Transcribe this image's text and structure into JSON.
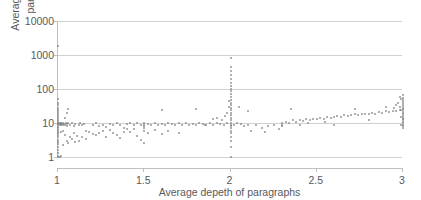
{
  "chart_data": {
    "type": "scatter",
    "title": "",
    "xlabel": "Average depeth of paragraphs",
    "ylabel_line1": "Average #triples of",
    "ylabel_line2": "paragraphs",
    "xlim": [
      1,
      3
    ],
    "ylim": [
      1,
      10000
    ],
    "yscale": "log",
    "xscale": "linear",
    "grid": true,
    "legend": false,
    "xticks": [
      "1",
      "1.5",
      "2",
      "2.5",
      "3"
    ],
    "xtick_values": [
      1,
      1.5,
      2,
      2.5,
      3
    ],
    "yticks": [
      "1",
      "10",
      "100",
      "1000",
      "10000"
    ],
    "ytick_values": [
      1,
      10,
      100,
      1000,
      10000
    ],
    "marker_color": "#808285",
    "gridline_color": "#d0d0d0",
    "axis_color": "#bfbfbf",
    "text_color": "#58595b",
    "points": [
      [
        1.0,
        1.0
      ],
      [
        1.0,
        1.1
      ],
      [
        1.0,
        1.3
      ],
      [
        1.0,
        1.6
      ],
      [
        1.0,
        2.0
      ],
      [
        1.0,
        2.4
      ],
      [
        1.0,
        2.8
      ],
      [
        1.0,
        3.2
      ],
      [
        1.0,
        3.8
      ],
      [
        1.0,
        4.4
      ],
      [
        1.0,
        5.0
      ],
      [
        1.0,
        5.6
      ],
      [
        1.0,
        6.2
      ],
      [
        1.0,
        7.0
      ],
      [
        1.0,
        7.8
      ],
      [
        1.0,
        8.6
      ],
      [
        1.0,
        9.4
      ],
      [
        1.0,
        10.0
      ],
      [
        1.0,
        11.0
      ],
      [
        1.0,
        12.5
      ],
      [
        1.0,
        14.0
      ],
      [
        1.0,
        16.0
      ],
      [
        1.0,
        18.0
      ],
      [
        1.0,
        21.0
      ],
      [
        1.0,
        24.0
      ],
      [
        1.0,
        28.0
      ],
      [
        1.0,
        33.0
      ],
      [
        1.0,
        40.0
      ],
      [
        1.0,
        50.0
      ],
      [
        1.0,
        1800.0
      ],
      [
        1.005,
        9.5
      ],
      [
        1.01,
        9.0
      ],
      [
        1.012,
        9.8
      ],
      [
        1.015,
        8.5
      ],
      [
        1.02,
        9.2
      ],
      [
        1.02,
        10.0
      ],
      [
        1.025,
        9.6
      ],
      [
        1.03,
        8.8
      ],
      [
        1.03,
        10.2
      ],
      [
        1.035,
        9.4
      ],
      [
        1.04,
        9.0
      ],
      [
        1.045,
        10.0
      ],
      [
        1.05,
        9.3
      ],
      [
        1.05,
        8.0
      ],
      [
        1.06,
        9.9
      ],
      [
        1.01,
        1.0
      ],
      [
        1.02,
        1.05
      ],
      [
        1.03,
        2.2
      ],
      [
        1.04,
        4.5
      ],
      [
        1.05,
        3.0
      ],
      [
        1.06,
        2.6
      ],
      [
        1.02,
        5.5
      ],
      [
        1.03,
        6.0
      ],
      [
        1.04,
        14.0
      ],
      [
        1.05,
        20.0
      ],
      [
        1.06,
        25.0
      ],
      [
        1.07,
        9.0
      ],
      [
        1.08,
        10.0
      ],
      [
        1.09,
        8.0
      ],
      [
        1.1,
        9.5
      ],
      [
        1.07,
        4.0
      ],
      [
        1.08,
        3.5
      ],
      [
        1.09,
        5.0
      ],
      [
        1.1,
        2.8
      ],
      [
        1.11,
        4.2
      ],
      [
        1.12,
        9.0
      ],
      [
        1.13,
        10.0
      ],
      [
        1.14,
        8.5
      ],
      [
        1.15,
        9.5
      ],
      [
        1.16,
        6.0
      ],
      [
        1.12,
        3.0
      ],
      [
        1.14,
        4.0
      ],
      [
        1.16,
        3.4
      ],
      [
        1.18,
        5.5
      ],
      [
        1.2,
        4.8
      ],
      [
        1.2,
        9.0
      ],
      [
        1.22,
        10.0
      ],
      [
        1.24,
        8.0
      ],
      [
        1.26,
        9.0
      ],
      [
        1.28,
        7.5
      ],
      [
        1.22,
        4.5
      ],
      [
        1.24,
        5.2
      ],
      [
        1.26,
        5.8
      ],
      [
        1.28,
        4.0
      ],
      [
        1.3,
        6.2
      ],
      [
        1.3,
        9.5
      ],
      [
        1.32,
        8.8
      ],
      [
        1.34,
        10.0
      ],
      [
        1.36,
        9.0
      ],
      [
        1.38,
        7.0
      ],
      [
        1.32,
        5.0
      ],
      [
        1.34,
        4.4
      ],
      [
        1.36,
        3.6
      ],
      [
        1.38,
        5.4
      ],
      [
        1.4,
        6.5
      ],
      [
        1.4,
        9.2
      ],
      [
        1.42,
        10.0
      ],
      [
        1.44,
        8.6
      ],
      [
        1.46,
        9.8
      ],
      [
        1.48,
        9.0
      ],
      [
        1.42,
        5.6
      ],
      [
        1.44,
        6.8
      ],
      [
        1.46,
        4.2
      ],
      [
        1.48,
        3.2
      ],
      [
        1.5,
        7.2
      ],
      [
        1.5,
        9.0
      ],
      [
        1.5,
        10.0
      ],
      [
        1.5,
        8.4
      ],
      [
        1.5,
        6.0
      ],
      [
        1.5,
        2.5
      ],
      [
        1.52,
        9.5
      ],
      [
        1.54,
        9.0
      ],
      [
        1.56,
        10.0
      ],
      [
        1.58,
        8.8
      ],
      [
        1.6,
        9.4
      ],
      [
        1.52,
        5.0
      ],
      [
        1.56,
        6.2
      ],
      [
        1.6,
        4.6
      ],
      [
        1.62,
        9.0
      ],
      [
        1.64,
        10.0
      ],
      [
        1.66,
        9.2
      ],
      [
        1.68,
        8.5
      ],
      [
        1.7,
        9.8
      ],
      [
        1.72,
        9.0
      ],
      [
        1.74,
        10.0
      ],
      [
        1.76,
        8.8
      ],
      [
        1.78,
        9.5
      ],
      [
        1.8,
        9.0
      ],
      [
        1.82,
        10.0
      ],
      [
        1.84,
        9.2
      ],
      [
        1.86,
        8.6
      ],
      [
        1.88,
        9.8
      ],
      [
        1.9,
        9.0
      ],
      [
        1.92,
        10.0
      ],
      [
        1.94,
        9.4
      ],
      [
        1.96,
        9.0
      ],
      [
        1.98,
        10.0
      ],
      [
        1.6,
        24.0
      ],
      [
        1.64,
        6.0
      ],
      [
        1.7,
        5.0
      ],
      [
        1.8,
        26.0
      ],
      [
        1.85,
        9.0
      ],
      [
        1.9,
        13.0
      ],
      [
        1.92,
        14.0
      ],
      [
        1.95,
        12.0
      ],
      [
        1.97,
        16.0
      ],
      [
        1.98,
        20.0
      ],
      [
        1.99,
        30.0
      ],
      [
        1.99,
        45.0
      ],
      [
        2.0,
        1.0
      ],
      [
        2.0,
        2.0
      ],
      [
        2.0,
        3.0
      ],
      [
        2.0,
        4.0
      ],
      [
        2.0,
        5.0
      ],
      [
        2.0,
        6.0
      ],
      [
        2.0,
        7.0
      ],
      [
        2.0,
        8.0
      ],
      [
        2.0,
        9.0
      ],
      [
        2.0,
        10.0
      ],
      [
        2.0,
        12.0
      ],
      [
        2.0,
        14.0
      ],
      [
        2.0,
        17.0
      ],
      [
        2.0,
        20.0
      ],
      [
        2.0,
        24.0
      ],
      [
        2.0,
        28.0
      ],
      [
        2.0,
        34.0
      ],
      [
        2.0,
        40.0
      ],
      [
        2.0,
        48.0
      ],
      [
        2.0,
        58.0
      ],
      [
        2.0,
        70.0
      ],
      [
        2.0,
        85.0
      ],
      [
        2.0,
        100.0
      ],
      [
        2.0,
        120.0
      ],
      [
        2.0,
        150.0
      ],
      [
        2.0,
        200.0
      ],
      [
        2.0,
        260.0
      ],
      [
        2.0,
        340.0
      ],
      [
        2.0,
        450.0
      ],
      [
        2.0,
        800.0
      ],
      [
        2.02,
        9.0
      ],
      [
        2.04,
        10.0
      ],
      [
        2.06,
        9.5
      ],
      [
        2.08,
        8.0
      ],
      [
        2.1,
        9.0
      ],
      [
        2.05,
        30.0
      ],
      [
        2.1,
        22.0
      ],
      [
        2.12,
        6.0
      ],
      [
        2.15,
        9.0
      ],
      [
        2.18,
        7.0
      ],
      [
        2.2,
        5.5
      ],
      [
        2.22,
        8.0
      ],
      [
        2.25,
        9.0
      ],
      [
        2.28,
        6.5
      ],
      [
        2.3,
        10.0
      ],
      [
        2.3,
        9.0
      ],
      [
        2.32,
        11.0
      ],
      [
        2.34,
        10.0
      ],
      [
        2.36,
        12.0
      ],
      [
        2.38,
        11.0
      ],
      [
        2.4,
        12.0
      ],
      [
        2.42,
        11.5
      ],
      [
        2.44,
        13.0
      ],
      [
        2.46,
        12.0
      ],
      [
        2.48,
        13.5
      ],
      [
        2.5,
        13.0
      ],
      [
        2.52,
        14.0
      ],
      [
        2.54,
        13.0
      ],
      [
        2.56,
        15.0
      ],
      [
        2.58,
        14.0
      ],
      [
        2.6,
        15.0
      ],
      [
        2.62,
        16.0
      ],
      [
        2.64,
        15.0
      ],
      [
        2.66,
        17.0
      ],
      [
        2.68,
        16.0
      ],
      [
        2.7,
        17.0
      ],
      [
        2.72,
        18.0
      ],
      [
        2.74,
        17.0
      ],
      [
        2.76,
        19.0
      ],
      [
        2.78,
        18.0
      ],
      [
        2.8,
        19.0
      ],
      [
        2.82,
        20.0
      ],
      [
        2.84,
        19.0
      ],
      [
        2.86,
        21.0
      ],
      [
        2.88,
        20.0
      ],
      [
        2.9,
        22.0
      ],
      [
        2.92,
        21.0
      ],
      [
        2.94,
        23.0
      ],
      [
        2.96,
        22.0
      ],
      [
        2.98,
        24.0
      ],
      [
        2.35,
        26.0
      ],
      [
        2.55,
        11.0
      ],
      [
        2.6,
        9.0
      ],
      [
        2.72,
        26.0
      ],
      [
        2.8,
        12.0
      ],
      [
        2.9,
        30.0
      ],
      [
        2.95,
        28.0
      ],
      [
        2.3,
        8.0
      ],
      [
        2.4,
        9.0
      ],
      [
        2.45,
        10.0
      ],
      [
        3.0,
        7.0
      ],
      [
        3.0,
        8.0
      ],
      [
        3.0,
        9.0
      ],
      [
        3.0,
        10.0
      ],
      [
        3.0,
        11.0
      ],
      [
        3.0,
        12.0
      ],
      [
        3.0,
        13.0
      ],
      [
        3.0,
        14.0
      ],
      [
        3.0,
        16.0
      ],
      [
        3.0,
        18.0
      ],
      [
        3.0,
        20.0
      ],
      [
        3.0,
        22.0
      ],
      [
        3.0,
        25.0
      ],
      [
        3.0,
        28.0
      ],
      [
        3.0,
        32.0
      ],
      [
        3.0,
        36.0
      ],
      [
        3.0,
        42.0
      ],
      [
        3.0,
        48.0
      ],
      [
        3.0,
        55.0
      ],
      [
        3.0,
        65.0
      ],
      [
        2.99,
        9.0
      ],
      [
        2.99,
        15.0
      ],
      [
        2.99,
        24.0
      ],
      [
        2.98,
        30.0
      ],
      [
        2.97,
        40.0
      ],
      [
        2.96,
        35.0
      ],
      [
        2.99,
        50.0
      ],
      [
        2.98,
        60.0
      ]
    ]
  }
}
